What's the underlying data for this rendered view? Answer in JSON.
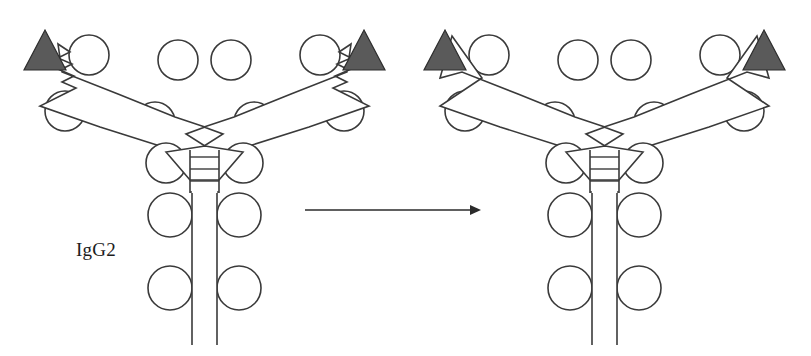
{
  "figure": {
    "background_color": "#ffffff",
    "width": 811,
    "height": 356,
    "outline_color": "#3a3a3a",
    "antigen_fill_color": "#5a5a5a",
    "arrow_color": "#2b2b2b"
  },
  "labels": {
    "igg2": "IgG2"
  },
  "reaction_arrow": {
    "direction": "right",
    "x_start": 305,
    "x_end": 477,
    "y": 210
  },
  "structures": [
    {
      "id": "left-antibody",
      "name": "IgG2 antibody with jagged Fab arm tips",
      "label": "IgG2",
      "center_x": 205,
      "fab_tip_style": "jagged",
      "antigen_count": 2,
      "hinge_disulfide_count": 4,
      "fab_lobe_count": 8,
      "fc_lobe_count": 4
    },
    {
      "id": "right-antibody",
      "name": "IgG2 antibody with smooth Fab arm tips",
      "label": "",
      "center_x": 605,
      "fab_tip_style": "smooth",
      "antigen_count": 2,
      "hinge_disulfide_count": 4,
      "fab_lobe_count": 8,
      "fc_lobe_count": 4
    }
  ],
  "antigens": [
    {
      "id": "antigen-left-1",
      "structure": "left-antibody",
      "side": "left",
      "shape": "triangle"
    },
    {
      "id": "antigen-left-2",
      "structure": "left-antibody",
      "side": "right",
      "shape": "triangle"
    },
    {
      "id": "antigen-right-1",
      "structure": "right-antibody",
      "side": "left",
      "shape": "triangle"
    },
    {
      "id": "antigen-right-2",
      "structure": "right-antibody",
      "side": "right",
      "shape": "triangle"
    }
  ]
}
